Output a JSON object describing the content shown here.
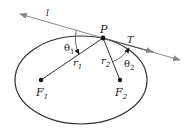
{
  "diagram": {
    "ellipse": {
      "cx": 81,
      "cy": 80,
      "rx": 66,
      "ry": 44,
      "stroke": "#333333"
    },
    "point_P": {
      "label": "P",
      "x": 103,
      "y": 38
    },
    "focus_1": {
      "label": "F",
      "sub": "1",
      "x": 41,
      "y": 80
    },
    "focus_2": {
      "label": "F",
      "sub": "2",
      "x": 120,
      "y": 80
    },
    "tangent_line": {
      "label": "l",
      "color": "#888888"
    },
    "tangent_vector": {
      "label": "T"
    },
    "segment_r1": {
      "label": "r",
      "sub": "1"
    },
    "segment_r2": {
      "label": "r",
      "sub": "2"
    },
    "angle_1": {
      "label": "θ",
      "sub": "1"
    },
    "angle_2": {
      "label": "θ",
      "sub": "2"
    }
  }
}
